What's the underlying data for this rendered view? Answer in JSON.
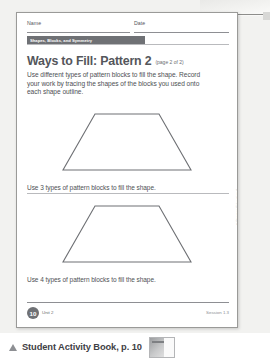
{
  "scan": {
    "sheet": {
      "name_label": "Name",
      "date_label": "Date",
      "unit_banner": "Shapes, Blocks, and Symmetry",
      "title": "Ways to Fill: Pattern 2",
      "title_sub": "(page 2 of 2)",
      "instructions": "Use different types of pattern blocks to fill the shape. Record your work by tracing the shapes of the blocks you used onto each shape outline.",
      "problems": [
        {
          "caption": "Use 3 types of pattern blocks to fill the shape."
        },
        {
          "caption": "Use 4 types of pattern blocks to fill the shape."
        }
      ],
      "footer": {
        "page_number": "10",
        "unit": "Unit 2",
        "session": "Session 1.3"
      },
      "side_copyright": "© Pearson Education 4"
    }
  },
  "caption_bar": {
    "marker_icon": "triangle-up-icon",
    "text": "Student Activity Book, p. 10",
    "thumbnail_icon": "page-thumbnail-icon"
  },
  "colors": {
    "banner": "#6f7175",
    "title": "#54565b",
    "body_text": "#4e5054",
    "rule": "#8e8f93",
    "scan_bg": "#f2f2f0"
  }
}
